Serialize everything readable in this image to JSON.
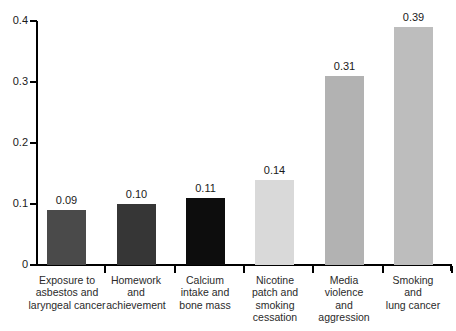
{
  "chart_data": {
    "type": "bar",
    "title": "",
    "subtitle": "",
    "xlabel": "",
    "ylabel": "",
    "ylim": [
      0,
      0.4
    ],
    "grid": false,
    "legend": "none",
    "y_ticks": [
      "0",
      "0.1",
      "0.2",
      "0.3",
      "0.4"
    ],
    "y_tick_values": [
      0,
      0.1,
      0.2,
      0.3,
      0.4
    ],
    "categories": [
      "Exposure to asbestos and laryngeal cancer",
      "Homework and achievement",
      "Calcium intake and bone mass",
      "Nicotine patch and smoking cessation",
      "Media violence and aggression",
      "Smoking and lung cancer"
    ],
    "category_lines": [
      [
        "Exposure to",
        "asbestos and",
        "laryngeal cancer"
      ],
      [
        "Homework",
        "and",
        "achievement"
      ],
      [
        "Calcium",
        "intake and",
        "bone mass"
      ],
      [
        "Nicotine",
        "patch and",
        "smoking",
        "cessation"
      ],
      [
        "Media",
        "violence",
        "and",
        "aggression"
      ],
      [
        "Smoking",
        "and",
        "lung cancer"
      ]
    ],
    "values": [
      0.09,
      0.1,
      0.11,
      0.14,
      0.31,
      0.39
    ],
    "value_labels": [
      "0.09",
      "0.10",
      "0.11",
      "0.14",
      "0.31",
      "0.39"
    ],
    "bar_colors": [
      "#4a4a4a",
      "#363636",
      "#0d0d0d",
      "#d9d9d9",
      "#b2b2b2",
      "#bdbdbd"
    ],
    "axis_color": "#000000",
    "background_color": "#ffffff",
    "text_color": "#1a1a1a"
  }
}
